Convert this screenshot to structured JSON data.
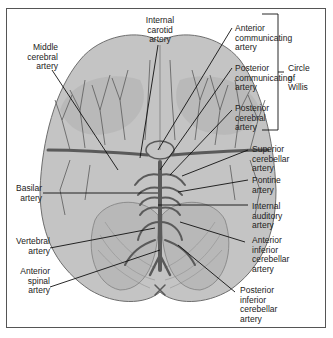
{
  "diagram": {
    "labels_left": [
      {
        "id": "middle-cerebral",
        "lines": [
          "Middle",
          "cerebral",
          "artery"
        ]
      },
      {
        "id": "basilar",
        "lines": [
          "Basilar",
          "artery"
        ]
      },
      {
        "id": "vertebral",
        "lines": [
          "Vertebral",
          "artery"
        ]
      },
      {
        "id": "anterior-spinal",
        "lines": [
          "Anterior",
          "spinal",
          "artery"
        ]
      }
    ],
    "labels_top": [
      {
        "id": "internal-carotid",
        "lines": [
          "Internal",
          "carotid",
          "artery"
        ]
      }
    ],
    "labels_right": [
      {
        "id": "anterior-communicating",
        "lines": [
          "Anterior",
          "communicating",
          "artery"
        ]
      },
      {
        "id": "posterior-communicating",
        "lines": [
          "Posterior",
          "communicating",
          "artery"
        ]
      },
      {
        "id": "posterior-cerebral",
        "lines": [
          "Posterior",
          "cerebral",
          "artery"
        ]
      },
      {
        "id": "superior-cerebellar",
        "lines": [
          "Superior",
          "cerebellar",
          "artery"
        ]
      },
      {
        "id": "pontine",
        "lines": [
          "Pontine",
          "artery"
        ]
      },
      {
        "id": "internal-auditory",
        "lines": [
          "Internal",
          "auditory",
          "artery"
        ]
      },
      {
        "id": "anterior-inferior-cerebellar",
        "lines": [
          "Anterior",
          "inferior",
          "cerebellar",
          "artery"
        ]
      },
      {
        "id": "posterior-inferior-cerebellar",
        "lines": [
          "Posterior",
          "inferior",
          "cerebellar",
          "artery"
        ]
      }
    ],
    "bracket": {
      "lines": [
        "Circle",
        "of",
        "Willis"
      ]
    },
    "colors": {
      "brain_fill": "#c4c4c4",
      "brain_dark": "#a9a9a9",
      "vessel": "#5a5a5a",
      "outline": "#6e6e6e",
      "leader": "#111111"
    }
  }
}
